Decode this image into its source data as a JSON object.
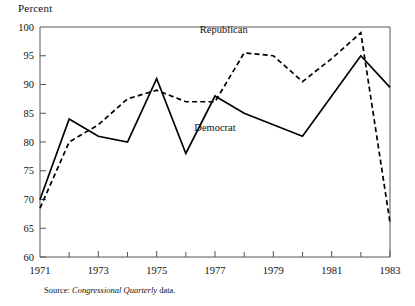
{
  "chart_data": {
    "type": "line",
    "title": "Percent",
    "xlabel": "",
    "ylabel": "Percent",
    "xlim": [
      1971,
      1983
    ],
    "ylim": [
      60,
      100
    ],
    "grid": false,
    "legend_position": "inline-annotation",
    "x": [
      1971,
      1972,
      1973,
      1974,
      1975,
      1976,
      1977,
      1978,
      1979,
      1980,
      1981,
      1982,
      1983
    ],
    "xticks_major": [
      1971,
      1973,
      1975,
      1977,
      1979,
      1981,
      1983
    ],
    "xticks_minor": [
      1972,
      1974,
      1976,
      1978,
      1980,
      1982
    ],
    "yticks": [
      60,
      65,
      70,
      75,
      80,
      85,
      90,
      95,
      100
    ],
    "series": [
      {
        "name": "Republican",
        "style": "dashed",
        "values": [
          68.5,
          80.0,
          83.0,
          87.5,
          89.0,
          87.0,
          87.0,
          95.5,
          95.0,
          90.5,
          94.5,
          99.0,
          66.0
        ]
      },
      {
        "name": "Democrat",
        "style": "solid",
        "values": [
          70.0,
          84.0,
          81.0,
          80.0,
          91.0,
          78.0,
          88.0,
          85.0,
          83.0,
          81.0,
          88.0,
          95.0,
          89.5
        ]
      }
    ],
    "annotations": [
      {
        "text": "Republican",
        "x": 1977.3,
        "y": 99.0
      },
      {
        "text": "Democrat",
        "x": 1977.0,
        "y": 82.0
      }
    ],
    "source": {
      "label": "Source:",
      "italic_text": "Congressional Quarterly",
      "trailing_text": " data."
    },
    "colors": {
      "line": "#000000",
      "axis": "#555555",
      "background": "#ffffff",
      "text": "#111111"
    }
  }
}
